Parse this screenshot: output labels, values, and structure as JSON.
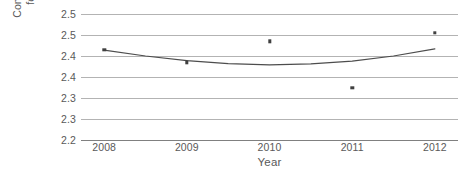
{
  "chart_data": {
    "type": "scatter",
    "title": "",
    "xlabel": "Year",
    "ylabel_lines": [
      "Conversion Factor",
      "for Electricity"
    ],
    "x": [
      2008,
      2009,
      2010,
      2011,
      2012
    ],
    "xtick_labels": [
      "2008",
      "2009",
      "2010",
      "2011",
      "2012"
    ],
    "xlim": [
      2007.72,
      2012.28
    ],
    "values": [
      2.415,
      2.385,
      2.435,
      2.325,
      2.455
    ],
    "series": [
      {
        "name": "Conversion factor",
        "type": "scatter",
        "marker": "square",
        "color": "#404040",
        "values": [
          2.415,
          2.385,
          2.435,
          2.325,
          2.455
        ]
      },
      {
        "name": "Fitted trend",
        "type": "line",
        "color": "#4d4d4d",
        "x": [
          2008.0,
          2008.5,
          2009.0,
          2009.5,
          2010.0,
          2010.5,
          2011.0,
          2011.5,
          2012.0
        ],
        "values": [
          2.414,
          2.4,
          2.389,
          2.382,
          2.379,
          2.381,
          2.388,
          2.4,
          2.417
        ]
      }
    ],
    "ylim": [
      2.2,
      2.5
    ],
    "ytick_values": [
      2.5,
      2.45,
      2.4,
      2.35,
      2.3,
      2.25,
      2.2
    ],
    "ytick_labels": [
      "2.5",
      "2.5",
      "2.4",
      "2.4",
      "2.3",
      "2.3",
      "2.2"
    ],
    "grid": true,
    "grid_axis": "y",
    "legend": false,
    "gridline_color": "#b3b3b3",
    "axis_color": "#808080",
    "text_color": "#595959",
    "background": "#ffffff"
  }
}
